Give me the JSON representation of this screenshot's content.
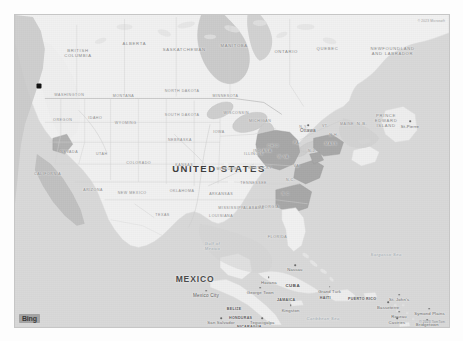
{
  "app": {
    "provider": "Bing",
    "map_type": "road-grayscale"
  },
  "attribution": {
    "top_right": "© 2023 Microsoft",
    "bottom_right": "© 2023 TomTom"
  },
  "marker": {
    "name": "point-marker",
    "color": "#111111",
    "x_pct": 5.6,
    "y_pct": 22.6
  },
  "colors": {
    "water": "#d9d9d9",
    "land": "#f2f2f2",
    "land_alt": "#eaeaea",
    "highlight": "#a9a9a9",
    "border": "#c6c6c6",
    "label": "#6f6f6f"
  },
  "labels": {
    "countries": [
      {
        "text": "UNITED STATES",
        "x": 47.0,
        "y": 49.0,
        "cls": "country-lg"
      },
      {
        "text": "MEXICO",
        "x": 41.5,
        "y": 84.5,
        "cls": "country"
      },
      {
        "text": "CUBA",
        "x": 64.0,
        "y": 86.5,
        "cls": "small-ctry"
      },
      {
        "text": "HAITI",
        "x": 71.5,
        "y": 90.8,
        "cls": "tiny-ctry"
      },
      {
        "text": "JAMAICA",
        "x": 62.5,
        "y": 91.5,
        "cls": "tiny-ctry"
      },
      {
        "text": "PUERTO RICO",
        "x": 80.0,
        "y": 91.0,
        "cls": "tiny-ctry"
      },
      {
        "text": "BELIZE",
        "x": 50.5,
        "y": 94.2,
        "cls": "tiny-ctry"
      },
      {
        "text": "HONDURAS",
        "x": 52.0,
        "y": 97.0,
        "cls": "tiny-ctry"
      },
      {
        "text": "NICARAGUA",
        "x": 54.0,
        "y": 100.0,
        "cls": "tiny-ctry"
      }
    ],
    "provinces": [
      {
        "text": "BRITISH\nCOLUMBIA",
        "x": 14.5,
        "y": 12.5
      },
      {
        "text": "ALBERTA",
        "x": 27.5,
        "y": 9.0
      },
      {
        "text": "SASKATCHEWAN",
        "x": 39.0,
        "y": 11.0
      },
      {
        "text": "MANITOBA",
        "x": 50.5,
        "y": 9.5
      },
      {
        "text": "ONTARIO",
        "x": 62.5,
        "y": 11.5
      },
      {
        "text": "QUEBEC",
        "x": 72.0,
        "y": 10.5
      },
      {
        "text": "NEWFOUNDLAND\nAND LABRADOR",
        "x": 87.0,
        "y": 12.0
      },
      {
        "text": "PRINCE\nEDWARD\nISLAND",
        "x": 85.5,
        "y": 34.0
      },
      {
        "text": "N.B.",
        "x": 80.0,
        "y": 34.5
      }
    ],
    "states": [
      {
        "text": "WASHINGTON",
        "x": 12.5,
        "y": 25.5
      },
      {
        "text": "MONTANA",
        "x": 25.0,
        "y": 26.0
      },
      {
        "text": "NORTH DAKOTA",
        "x": 38.5,
        "y": 24.5
      },
      {
        "text": "MINNESOTA",
        "x": 48.5,
        "y": 26.0
      },
      {
        "text": "OREGON",
        "x": 11.0,
        "y": 33.5
      },
      {
        "text": "IDAHO",
        "x": 18.5,
        "y": 33.0
      },
      {
        "text": "WYOMING",
        "x": 25.5,
        "y": 34.5
      },
      {
        "text": "SOUTH DAKOTA",
        "x": 38.5,
        "y": 32.0
      },
      {
        "text": "IOWA",
        "x": 47.0,
        "y": 37.5
      },
      {
        "text": "NEBRASKA",
        "x": 38.0,
        "y": 40.0
      },
      {
        "text": "NEVADA",
        "x": 12.5,
        "y": 44.0
      },
      {
        "text": "UTAH",
        "x": 20.0,
        "y": 44.5
      },
      {
        "text": "COLORADO",
        "x": 28.5,
        "y": 47.5
      },
      {
        "text": "KANSAS",
        "x": 39.0,
        "y": 48.0
      },
      {
        "text": "MISSOURI",
        "x": 49.0,
        "y": 49.5
      },
      {
        "text": "ILLINOIS",
        "x": 55.0,
        "y": 44.5
      },
      {
        "text": "CALIFORNIA",
        "x": 7.5,
        "y": 51.0
      },
      {
        "text": "ARIZONA",
        "x": 18.0,
        "y": 56.0
      },
      {
        "text": "NEW MEXICO",
        "x": 27.0,
        "y": 57.0
      },
      {
        "text": "OKLAHOMA",
        "x": 38.5,
        "y": 56.5
      },
      {
        "text": "ARKANSAS",
        "x": 47.5,
        "y": 57.5
      },
      {
        "text": "TENNESSEE",
        "x": 55.0,
        "y": 54.0
      },
      {
        "text": "KENTUCKY",
        "x": 56.5,
        "y": 49.0
      },
      {
        "text": "MISSISSIPPI",
        "x": 50.0,
        "y": 62.0
      },
      {
        "text": "ALABAMA",
        "x": 55.0,
        "y": 62.0
      },
      {
        "text": "LOUISIANA",
        "x": 47.5,
        "y": 64.5
      },
      {
        "text": "TEXAS",
        "x": 34.0,
        "y": 64.0
      },
      {
        "text": "FLORIDA",
        "x": 60.5,
        "y": 71.0
      },
      {
        "text": "GEORGIA",
        "x": 58.5,
        "y": 61.5
      },
      {
        "text": "S.C.",
        "x": 62.5,
        "y": 57.5
      },
      {
        "text": "N.C.",
        "x": 63.5,
        "y": 53.0
      },
      {
        "text": "VA.",
        "x": 65.0,
        "y": 48.5
      },
      {
        "text": "W.VA.",
        "x": 62.0,
        "y": 45.5
      },
      {
        "text": "OHIO",
        "x": 59.5,
        "y": 42.0
      },
      {
        "text": "INDIANA",
        "x": 57.0,
        "y": 43.5
      },
      {
        "text": "MICHIGAN",
        "x": 56.5,
        "y": 34.0
      },
      {
        "text": "WISCONSIN",
        "x": 51.0,
        "y": 31.5
      },
      {
        "text": "PA.",
        "x": 65.0,
        "y": 41.0
      },
      {
        "text": "N.Y.",
        "x": 66.5,
        "y": 36.0
      },
      {
        "text": "MAINE",
        "x": 76.5,
        "y": 35.0
      },
      {
        "text": "VT.",
        "x": 71.5,
        "y": 35.5
      },
      {
        "text": "N.H.",
        "x": 73.5,
        "y": 38.5
      },
      {
        "text": "MASS.",
        "x": 73.0,
        "y": 41.5
      },
      {
        "text": "N.J.",
        "x": 68.5,
        "y": 43.5
      }
    ],
    "cities": [
      {
        "text": "Ottawa",
        "x": 67.5,
        "y": 36.8,
        "cls": "capital"
      },
      {
        "text": "Mexico City",
        "x": 44.0,
        "y": 89.8,
        "cls": "capital"
      },
      {
        "text": "Havana",
        "x": 58.5,
        "y": 85.5,
        "cls": "city"
      },
      {
        "text": "Nassau",
        "x": 64.5,
        "y": 81.5,
        "cls": "city"
      },
      {
        "text": "George Town",
        "x": 56.5,
        "y": 88.8,
        "cls": "city"
      },
      {
        "text": "Grand Turk",
        "x": 72.5,
        "y": 88.5,
        "cls": "city"
      },
      {
        "text": "Tegucigalpa",
        "x": 57.0,
        "y": 98.5,
        "cls": "city"
      },
      {
        "text": "San Salvador",
        "x": 47.5,
        "y": 98.5,
        "cls": "city"
      },
      {
        "text": "St. John's",
        "x": 88.5,
        "y": 91.0,
        "cls": "city"
      },
      {
        "text": "Basseterre",
        "x": 86.0,
        "y": 93.5,
        "cls": "city"
      },
      {
        "text": "Roseau",
        "x": 88.5,
        "y": 96.5,
        "cls": "city"
      },
      {
        "text": "Castries",
        "x": 88.0,
        "y": 98.5,
        "cls": "city"
      },
      {
        "text": "Bridgetown",
        "x": 95.0,
        "y": 99.0,
        "cls": "city"
      },
      {
        "text": "Symond Plains",
        "x": 95.5,
        "y": 95.5,
        "cls": "city"
      },
      {
        "text": "St-Pierre",
        "x": 91.0,
        "y": 35.5,
        "cls": "city"
      },
      {
        "text": "Kingston",
        "x": 63.5,
        "y": 94.5,
        "cls": "city"
      }
    ],
    "water_bodies": [
      {
        "text": "Gulf of\nMexico",
        "x": 45.5,
        "y": 74.5
      },
      {
        "text": "Sargasso Sea",
        "x": 85.5,
        "y": 76.5
      },
      {
        "text": "Caribbean Sea",
        "x": 71.0,
        "y": 97.0
      }
    ]
  }
}
